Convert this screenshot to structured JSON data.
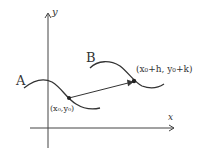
{
  "axes": {
    "x_label": "x",
    "y_label": "y"
  },
  "curves": [
    {
      "name": "A"
    },
    {
      "name": "B"
    }
  ],
  "points": {
    "start": "(x₀,y₀)",
    "end": "(x₀+h, y₀+k)"
  },
  "colors": {
    "ink": "#333333"
  }
}
